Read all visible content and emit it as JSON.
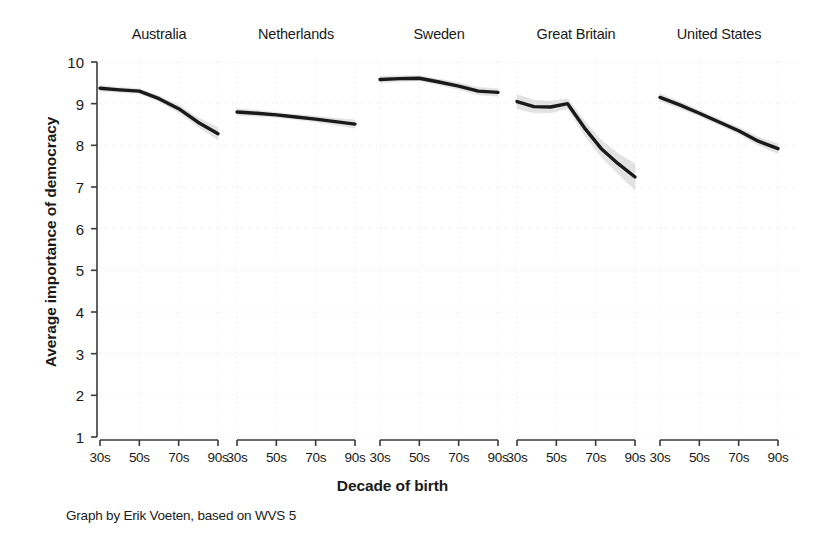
{
  "chart_data": {
    "type": "line",
    "title": "",
    "xlabel": "Decade of birth",
    "ylabel": "Average importance of democracy",
    "caption": "Graph by Erik Voeten, based on WVS 5",
    "ylim": [
      1,
      10
    ],
    "ytick_labels": [
      "10",
      "9",
      "8",
      "7",
      "6",
      "5",
      "4",
      "3",
      "2",
      "1"
    ],
    "ytick_values": [
      10,
      9,
      8,
      7,
      6,
      5,
      4,
      3,
      2,
      1
    ],
    "categories": [
      "30s",
      "50s",
      "70s",
      "90s"
    ],
    "grid": "faint-dotted",
    "legend": "none",
    "band": "95% confidence interval (light grey)",
    "panels": [
      {
        "name": "Australia",
        "x": [
          "30s",
          "40s",
          "50s",
          "60s",
          "70s",
          "80s",
          "90s"
        ],
        "values": [
          9.37,
          9.33,
          9.3,
          9.12,
          8.88,
          8.55,
          8.28
        ],
        "ci_low": [
          9.3,
          9.27,
          9.24,
          9.05,
          8.79,
          8.44,
          8.13
        ],
        "ci_high": [
          9.44,
          9.39,
          9.36,
          9.19,
          8.97,
          8.66,
          8.43
        ]
      },
      {
        "name": "Netherlands",
        "x": [
          "30s",
          "40s",
          "50s",
          "60s",
          "70s",
          "80s",
          "90s"
        ],
        "values": [
          8.8,
          8.77,
          8.73,
          8.68,
          8.63,
          8.57,
          8.51
        ],
        "ci_low": [
          8.72,
          8.7,
          8.67,
          8.62,
          8.56,
          8.49,
          8.41
        ],
        "ci_high": [
          8.88,
          8.84,
          8.79,
          8.74,
          8.7,
          8.65,
          8.61
        ]
      },
      {
        "name": "Sweden",
        "x": [
          "30s",
          "40s",
          "50s",
          "60s",
          "70s",
          "80s",
          "90s"
        ],
        "values": [
          9.58,
          9.6,
          9.61,
          9.52,
          9.42,
          9.3,
          9.27
        ],
        "ci_low": [
          9.5,
          9.53,
          9.55,
          9.45,
          9.34,
          9.21,
          9.18
        ],
        "ci_high": [
          9.66,
          9.67,
          9.67,
          9.59,
          9.5,
          9.39,
          9.36
        ]
      },
      {
        "name": "Great Britain",
        "x": [
          "30s",
          "40s",
          "50s",
          "60s",
          "70s",
          "80s",
          "90s"
        ],
        "values": [
          9.05,
          8.93,
          8.92,
          9.0,
          8.42,
          7.92,
          7.56,
          7.24
        ],
        "ci_low": [
          8.88,
          8.78,
          8.78,
          8.88,
          8.25,
          7.72,
          7.32,
          6.92
        ],
        "ci_high": [
          9.22,
          9.08,
          9.06,
          9.12,
          8.59,
          8.12,
          7.8,
          7.56
        ]
      },
      {
        "name": "United States",
        "x": [
          "30s",
          "40s",
          "50s",
          "60s",
          "70s",
          "80s",
          "90s"
        ],
        "values": [
          9.15,
          8.97,
          8.77,
          8.56,
          8.35,
          8.1,
          7.92
        ],
        "ci_low": [
          9.06,
          8.89,
          8.7,
          8.49,
          8.27,
          8.0,
          7.8
        ],
        "ci_high": [
          9.24,
          9.05,
          8.84,
          8.63,
          8.43,
          8.2,
          8.04
        ]
      }
    ],
    "colors": {
      "line": "#1a1a1a",
      "band": "#d9d9d9",
      "axis": "#3a3a3a",
      "grid": "#e8e8e8",
      "background": "#ffffff",
      "text": "#1a1a1a"
    }
  }
}
